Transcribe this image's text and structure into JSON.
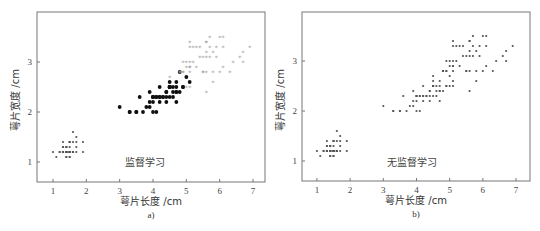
{
  "chart_data": [
    {
      "type": "scatter",
      "panel": "a",
      "caption": "a)",
      "annotation": "监督学习",
      "xlabel": "萼片长度 /cm",
      "ylabel": "萼片宽度 /cm",
      "xlim": [
        0.52,
        7.36
      ],
      "ylim": [
        0.6,
        4.0
      ],
      "xticks": [
        1,
        2,
        3,
        4,
        5,
        6,
        7
      ],
      "yticks": [
        1,
        2,
        3
      ],
      "grid": false,
      "legend": null,
      "series": [
        {
          "name": "class-1",
          "marker": "small-dot",
          "color": "#555555",
          "points": [
            [
              1.4,
              1.2
            ],
            [
              1.4,
              1.2
            ],
            [
              1.3,
              1.2
            ],
            [
              1.5,
              1.2
            ],
            [
              1.4,
              1.2
            ],
            [
              1.7,
              1.4
            ],
            [
              1.4,
              1.3
            ],
            [
              1.5,
              1.2
            ],
            [
              1.4,
              1.2
            ],
            [
              1.5,
              1.1
            ],
            [
              1.5,
              1.2
            ],
            [
              1.6,
              1.2
            ],
            [
              1.4,
              1.1
            ],
            [
              1.1,
              1.1
            ],
            [
              1.2,
              1.2
            ],
            [
              1.5,
              1.4
            ],
            [
              1.3,
              1.4
            ],
            [
              1.4,
              1.3
            ],
            [
              1.7,
              1.3
            ],
            [
              1.5,
              1.3
            ],
            [
              1.7,
              1.2
            ],
            [
              1.5,
              1.4
            ],
            [
              1.0,
              1.2
            ],
            [
              1.7,
              1.5
            ],
            [
              1.9,
              1.2
            ],
            [
              1.6,
              1.2
            ],
            [
              1.6,
              1.4
            ],
            [
              1.5,
              1.2
            ],
            [
              1.4,
              1.2
            ],
            [
              1.6,
              1.2
            ],
            [
              1.6,
              1.2
            ],
            [
              1.5,
              1.4
            ],
            [
              1.5,
              1.1
            ],
            [
              1.4,
              1.2
            ],
            [
              1.5,
              1.2
            ],
            [
              1.2,
              1.2
            ],
            [
              1.3,
              1.2
            ],
            [
              1.4,
              1.1
            ],
            [
              1.3,
              1.2
            ],
            [
              1.5,
              1.2
            ],
            [
              1.3,
              1.3
            ],
            [
              1.3,
              1.3
            ],
            [
              1.3,
              1.2
            ],
            [
              1.6,
              1.6
            ],
            [
              1.9,
              1.4
            ],
            [
              1.4,
              1.3
            ],
            [
              1.6,
              1.2
            ],
            [
              1.4,
              1.2
            ],
            [
              1.5,
              1.2
            ],
            [
              1.4,
              1.2
            ]
          ]
        },
        {
          "name": "class-2",
          "marker": "filled-circle",
          "color": "#111111",
          "points": [
            [
              4.7,
              2.4
            ],
            [
              4.5,
              2.5
            ],
            [
              4.9,
              2.5
            ],
            [
              4.0,
              2.3
            ],
            [
              4.6,
              2.5
            ],
            [
              4.5,
              2.3
            ],
            [
              4.7,
              2.6
            ],
            [
              3.3,
              2.0
            ],
            [
              4.6,
              2.3
            ],
            [
              3.9,
              2.4
            ],
            [
              3.5,
              2.0
            ],
            [
              4.2,
              2.5
            ],
            [
              4.0,
              2.0
            ],
            [
              4.7,
              2.4
            ],
            [
              3.6,
              2.3
            ],
            [
              4.4,
              2.4
            ],
            [
              4.5,
              2.5
            ],
            [
              4.1,
              2.0
            ],
            [
              4.5,
              2.5
            ],
            [
              3.9,
              2.1
            ],
            [
              4.8,
              2.8
            ],
            [
              4.0,
              2.3
            ],
            [
              4.9,
              2.5
            ],
            [
              4.7,
              2.2
            ],
            [
              4.3,
              2.3
            ],
            [
              4.4,
              2.4
            ],
            [
              4.8,
              2.4
            ],
            [
              5.0,
              2.7
            ],
            [
              4.5,
              2.5
            ],
            [
              3.5,
              2.0
            ],
            [
              3.8,
              2.1
            ],
            [
              3.7,
              2.0
            ],
            [
              3.9,
              2.2
            ],
            [
              5.1,
              2.6
            ],
            [
              4.5,
              2.5
            ],
            [
              4.5,
              2.6
            ],
            [
              4.7,
              2.5
            ],
            [
              4.4,
              2.3
            ],
            [
              4.1,
              2.3
            ],
            [
              4.0,
              2.3
            ],
            [
              4.4,
              2.2
            ],
            [
              4.6,
              2.4
            ],
            [
              4.0,
              2.2
            ],
            [
              3.3,
              2.0
            ],
            [
              4.2,
              2.3
            ],
            [
              4.2,
              2.2
            ],
            [
              4.2,
              2.3
            ],
            [
              4.3,
              2.3
            ],
            [
              3.0,
              2.1
            ],
            [
              4.1,
              2.3
            ]
          ]
        },
        {
          "name": "class-3",
          "marker": "light-star",
          "color": "#9a9a9a",
          "points": [
            [
              6.0,
              3.5
            ],
            [
              5.1,
              2.9
            ],
            [
              5.9,
              3.1
            ],
            [
              5.6,
              2.8
            ],
            [
              5.8,
              3.2
            ],
            [
              6.6,
              3.1
            ],
            [
              4.5,
              2.7
            ],
            [
              6.3,
              2.8
            ],
            [
              5.8,
              2.8
            ],
            [
              6.1,
              3.5
            ],
            [
              5.1,
              3.0
            ],
            [
              5.3,
              2.9
            ],
            [
              5.5,
              3.1
            ],
            [
              5.0,
              3.0
            ],
            [
              5.1,
              3.4
            ],
            [
              5.3,
              3.3
            ],
            [
              5.5,
              2.8
            ],
            [
              6.7,
              3.2
            ],
            [
              6.9,
              3.3
            ],
            [
              5.0,
              2.5
            ],
            [
              5.7,
              3.3
            ],
            [
              4.9,
              3.0
            ],
            [
              6.7,
              3.0
            ],
            [
              4.9,
              2.8
            ],
            [
              5.7,
              3.1
            ],
            [
              6.0,
              2.8
            ],
            [
              4.8,
              2.8
            ],
            [
              4.9,
              2.8
            ],
            [
              5.6,
              3.1
            ],
            [
              5.8,
              2.6
            ],
            [
              6.1,
              2.9
            ],
            [
              6.4,
              3.0
            ],
            [
              5.6,
              3.2
            ],
            [
              5.1,
              2.5
            ],
            [
              5.6,
              2.4
            ],
            [
              6.1,
              3.3
            ],
            [
              5.6,
              3.4
            ],
            [
              5.5,
              2.8
            ],
            [
              4.8,
              2.8
            ],
            [
              5.4,
              3.1
            ],
            [
              5.6,
              3.4
            ],
            [
              5.1,
              3.3
            ],
            [
              5.1,
              2.9
            ],
            [
              5.9,
              3.3
            ],
            [
              5.7,
              3.5
            ],
            [
              5.2,
              3.3
            ],
            [
              5.0,
              2.9
            ],
            [
              5.2,
              3.0
            ],
            [
              5.4,
              3.3
            ],
            [
              5.1,
              2.8
            ]
          ]
        }
      ]
    },
    {
      "type": "scatter",
      "panel": "b",
      "caption": "b)",
      "annotation": "无监督学习",
      "xlabel": "萼片长度 /cm",
      "ylabel": "萼片宽度 /cm",
      "xlim": [
        0.55,
        7.42
      ],
      "ylim": [
        0.6,
        3.98
      ],
      "xticks": [
        1,
        2,
        3,
        4,
        5,
        6,
        7
      ],
      "yticks": [
        1,
        2,
        3
      ],
      "grid": false,
      "legend": null,
      "series": [
        {
          "name": "unlabeled",
          "marker": "small-dot",
          "color": "#555555",
          "points": "same as panel a, all classes merged"
        }
      ]
    }
  ],
  "panels": {
    "a": {
      "caption": "a)",
      "annotation": "监督学习",
      "xlabel": "萼片长度 /cm",
      "ylabel": "萼片宽度 /cm"
    },
    "b": {
      "caption": "b)",
      "annotation": "无监督学习",
      "xlabel": "萼片长度 /cm",
      "ylabel": "萼片宽度 /cm"
    }
  },
  "colors": {
    "axis": "#777777",
    "dot": "#555555",
    "filled": "#111111",
    "light": "#9a9a9a"
  }
}
